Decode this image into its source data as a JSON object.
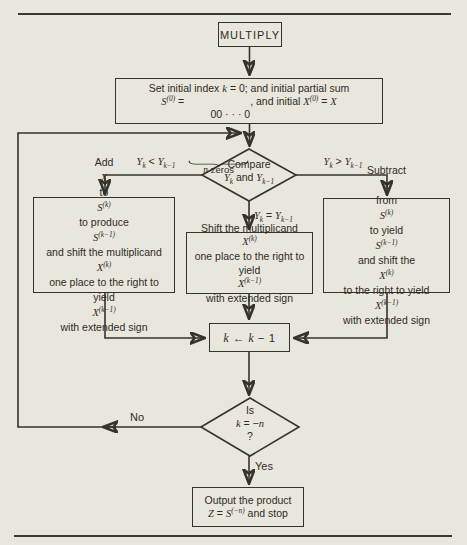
{
  "page": {
    "paper_color": "#e9e6dd",
    "ink_color": "#35332c",
    "description_colors": {
      "rules": "#3a3831",
      "text": "#2e2c26"
    }
  },
  "flowchart": {
    "start": {
      "label": "MULTIPLY"
    },
    "init": {
      "line1": "Set initial index |k| = 0; and initial partial sum",
      "line2_pre": "|S^{(0)}| = ",
      "zeros": "00 · · · 0",
      "line2_post": ", and initial |X^{(0)}| = |X|",
      "brace_label": "|n| zeros"
    },
    "compare": {
      "line1": "Compare",
      "line2": "|Y_{k}| and |Y_{k−1}|"
    },
    "branch_labels": {
      "less": "|Y_{k}| < |Y_{k−1}|",
      "equal": "|Y_{k}| = |Y_{k−1}|",
      "greater": "|Y_{k}| > |Y_{k−1}|"
    },
    "add_box": "Add |X| to |S^{(k)}| to produce |S^{(k−1)}| and shift the multiplicand |X^{(k)}| one place to the right to yield |X^{(k−1)}| with extended sign",
    "shift_box": "Shift the multiplicand |X^{(k)}| one place to the right to yield |X^{(k−1)}| with extended sign",
    "subtract_box": "Subtract |X| from |S^{(k)}| to yield |S^{(k−1)}| and shift the |X^{(k)}| to the right to yield |X^{(k−1)}| with extended sign",
    "decrement": {
      "label": "|k| ← |k| − 1"
    },
    "test": {
      "line1": "Is",
      "line2": "|k| = −|n|",
      "line3": "?"
    },
    "no_label": "No",
    "yes_label": "Yes",
    "output": {
      "line1": "Output the product",
      "line2": "|Z| = |S^{(−n)}| and stop"
    }
  }
}
